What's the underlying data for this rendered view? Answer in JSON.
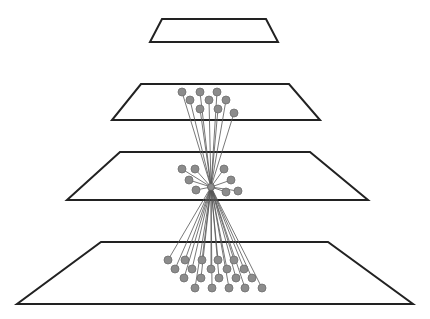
{
  "diagram": {
    "colors": {
      "background": "#ffffff",
      "plane_stroke": "#222222",
      "edge": "#555555",
      "node_fill": "#8c8c8c"
    },
    "planes": [
      {
        "id": "layer-1",
        "points": [
          [
            162,
            19
          ],
          [
            266,
            19
          ],
          [
            278,
            42
          ],
          [
            150,
            42
          ]
        ]
      },
      {
        "id": "layer-2",
        "points": [
          [
            141,
            84
          ],
          [
            289,
            84
          ],
          [
            320,
            120
          ],
          [
            112,
            120
          ]
        ]
      },
      {
        "id": "layer-3",
        "points": [
          [
            120,
            152
          ],
          [
            310,
            152
          ],
          [
            368,
            200
          ],
          [
            67,
            200
          ]
        ]
      },
      {
        "id": "layer-4",
        "points": [
          [
            101,
            242
          ],
          [
            328,
            242
          ],
          [
            413,
            304
          ],
          [
            17,
            304
          ]
        ]
      }
    ],
    "hub": {
      "x": 211,
      "y": 187,
      "r": 3.5
    },
    "node_radius": 4,
    "upper_nodes": [
      [
        182,
        92
      ],
      [
        200,
        92
      ],
      [
        217,
        92
      ],
      [
        190,
        100
      ],
      [
        209,
        100
      ],
      [
        226,
        100
      ],
      [
        200,
        109
      ],
      [
        218,
        109
      ],
      [
        234,
        113
      ]
    ],
    "local_nodes": [
      [
        182,
        169
      ],
      [
        195,
        169
      ],
      [
        224,
        169
      ],
      [
        189,
        180
      ],
      [
        231,
        180
      ],
      [
        196,
        190
      ],
      [
        226,
        192
      ],
      [
        238,
        191
      ]
    ],
    "lower_nodes": [
      [
        168,
        260
      ],
      [
        185,
        260
      ],
      [
        202,
        260
      ],
      [
        218,
        260
      ],
      [
        234,
        260
      ],
      [
        175,
        269
      ],
      [
        192,
        269
      ],
      [
        211,
        269
      ],
      [
        227,
        269
      ],
      [
        244,
        269
      ],
      [
        184,
        278
      ],
      [
        201,
        278
      ],
      [
        219,
        278
      ],
      [
        236,
        278
      ],
      [
        252,
        278
      ],
      [
        195,
        288
      ],
      [
        212,
        288
      ],
      [
        229,
        288
      ],
      [
        245,
        288
      ],
      [
        262,
        288
      ]
    ]
  }
}
